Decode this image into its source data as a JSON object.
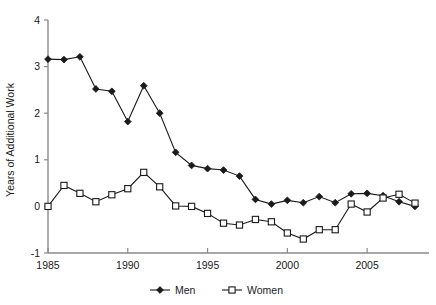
{
  "chart_data": {
    "type": "line",
    "title": "",
    "xlabel": "",
    "ylabel": "Years of Additional Work",
    "xlim": [
      1985,
      2008
    ],
    "ylim": [
      -1,
      4
    ],
    "xticks": [
      1985,
      1990,
      1995,
      2000,
      2005
    ],
    "yticks": [
      -1,
      0,
      1,
      2,
      3,
      4
    ],
    "xtick_labels": [
      "1985",
      "1990",
      "1995",
      "2000",
      "2005"
    ],
    "ytick_labels": [
      "-1",
      "0",
      "1",
      "2",
      "3",
      "4"
    ],
    "grid": false,
    "legend_position": "bottom",
    "x": [
      1985,
      1986,
      1987,
      1988,
      1989,
      1990,
      1991,
      1992,
      1993,
      1994,
      1995,
      1996,
      1997,
      1998,
      1999,
      2000,
      2001,
      2002,
      2003,
      2004,
      2005,
      2006,
      2007,
      2008
    ],
    "series": [
      {
        "name": "Men",
        "marker": "filled-diamond",
        "values": [
          3.16,
          3.15,
          3.21,
          2.52,
          2.47,
          1.82,
          2.59,
          2.0,
          1.16,
          0.88,
          0.81,
          0.78,
          0.65,
          0.15,
          0.05,
          0.13,
          0.08,
          0.21,
          0.08,
          0.27,
          0.28,
          0.23,
          0.1,
          0.0
        ]
      },
      {
        "name": "Women",
        "marker": "open-square",
        "values": [
          0.0,
          0.45,
          0.28,
          0.1,
          0.25,
          0.38,
          0.73,
          0.42,
          0.01,
          0.0,
          -0.15,
          -0.36,
          -0.4,
          -0.28,
          -0.33,
          -0.57,
          -0.7,
          -0.5,
          -0.5,
          0.05,
          -0.12,
          0.18,
          0.26,
          0.07
        ]
      }
    ]
  },
  "legend": {
    "entries": [
      {
        "label": "Men"
      },
      {
        "label": "Women"
      }
    ]
  },
  "colors": {
    "series": "#1a1a1a",
    "axis": "#8a8a8a",
    "background": "#ffffff"
  }
}
